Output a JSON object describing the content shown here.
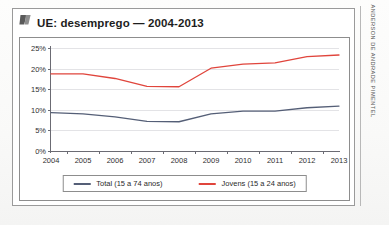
{
  "title": {
    "text": "UE: desemprego — 2004-2013",
    "icon": "quote-mark-icon"
  },
  "credit": {
    "text": "ANDERSON DE ANDRADE PIMENTEL"
  },
  "legend": {
    "position": "bottom-center",
    "items": [
      {
        "label": "Total (15 a 74 anos)",
        "color": "#555f77"
      },
      {
        "label": "Jovens (15 a 24 anos)",
        "color": "#e0453c"
      }
    ]
  },
  "chart_data": {
    "type": "line",
    "title": "UE: desemprego — 2004-2013",
    "xlabel": "",
    "ylabel": "",
    "categories": [
      "2004",
      "2005",
      "2006",
      "2007",
      "2008",
      "2009",
      "2010",
      "2011",
      "2012",
      "2013"
    ],
    "x": [
      2004,
      2005,
      2006,
      2007,
      2008,
      2009,
      2010,
      2011,
      2012,
      2013
    ],
    "ylim": [
      0,
      25
    ],
    "yticks": [
      0,
      5,
      10,
      15,
      20,
      25
    ],
    "ytick_labels": [
      "0%",
      "5%",
      "10%",
      "15%",
      "20%",
      "25%"
    ],
    "grid": true,
    "series": [
      {
        "name": "Total (15 a 74 anos)",
        "color": "#555f77",
        "values": [
          9.3,
          9.0,
          8.3,
          7.2,
          7.1,
          9.0,
          9.7,
          9.7,
          10.5,
          10.9
        ]
      },
      {
        "name": "Jovens (15 a 24 anos)",
        "color": "#e0453c",
        "values": [
          18.7,
          18.7,
          17.6,
          15.7,
          15.6,
          20.1,
          21.1,
          21.4,
          22.9,
          23.3
        ]
      }
    ]
  }
}
